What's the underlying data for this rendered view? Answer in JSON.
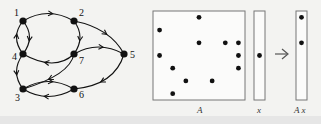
{
  "graph": {
    "nodes": [
      {
        "id": "1",
        "label": "1",
        "x": 23,
        "y": 21,
        "lx": 14,
        "ly": 16
      },
      {
        "id": "2",
        "label": "2",
        "x": 74,
        "y": 21,
        "lx": 79,
        "ly": 16
      },
      {
        "id": "4",
        "label": "4",
        "x": 23,
        "y": 54,
        "lx": 12,
        "ly": 60
      },
      {
        "id": "7",
        "label": "7",
        "x": 74,
        "y": 54,
        "lx": 79,
        "ly": 64
      },
      {
        "id": "5",
        "label": "5",
        "x": 124,
        "y": 54,
        "lx": 130,
        "ly": 58
      },
      {
        "id": "3",
        "label": "3",
        "x": 23,
        "y": 89,
        "lx": 15,
        "ly": 101
      },
      {
        "id": "6",
        "label": "6",
        "x": 74,
        "y": 89,
        "lx": 79,
        "ly": 98
      }
    ],
    "edges": [
      {
        "from": "1",
        "to": "2"
      },
      {
        "from": "1",
        "to": "4"
      },
      {
        "from": "4",
        "to": "1"
      },
      {
        "from": "2",
        "to": "7"
      },
      {
        "from": "2",
        "to": "5"
      },
      {
        "from": "7",
        "to": "5"
      },
      {
        "from": "7",
        "to": "4"
      },
      {
        "from": "7",
        "to": "3"
      },
      {
        "from": "4",
        "to": "3"
      },
      {
        "from": "5",
        "to": "6"
      },
      {
        "from": "3",
        "to": "6"
      },
      {
        "from": "6",
        "to": "3"
      }
    ]
  },
  "matrix": {
    "label": "A",
    "rows": 7,
    "cols": 7,
    "nonzeros": [
      [
        1,
        4
      ],
      [
        2,
        1
      ],
      [
        3,
        4
      ],
      [
        3,
        6
      ],
      [
        3,
        7
      ],
      [
        4,
        1
      ],
      [
        4,
        7
      ],
      [
        5,
        2
      ],
      [
        5,
        7
      ],
      [
        6,
        3
      ],
      [
        6,
        5
      ],
      [
        7,
        2
      ]
    ]
  },
  "vector_x": {
    "label": "x",
    "nonzero_rows": [
      4
    ]
  },
  "vector_ax": {
    "label": "A x",
    "nonzero_rows": [
      1,
      3
    ]
  },
  "arrow": {
    "symbol": "→"
  },
  "colors": {
    "ink": "#111111",
    "box": "#777777",
    "background": "#f3f3f1"
  }
}
